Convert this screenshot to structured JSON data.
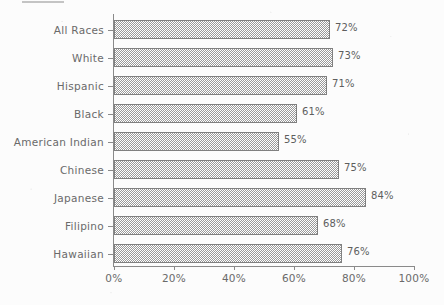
{
  "chart_data": {
    "type": "bar",
    "orientation": "horizontal",
    "title": "",
    "xlabel": "",
    "ylabel": "",
    "categories": [
      "All Races",
      "White",
      "Hispanic",
      "Black",
      "American Indian",
      "Chinese",
      "Japanese",
      "Filipino",
      "Hawaiian"
    ],
    "values": [
      72,
      73,
      71,
      61,
      55,
      75,
      84,
      68,
      76
    ],
    "value_labels": [
      "72%",
      "73%",
      "71%",
      "61%",
      "55%",
      "75%",
      "84%",
      "68%",
      "76%"
    ],
    "xlim": [
      0,
      100
    ],
    "xticks": [
      0,
      20,
      40,
      60,
      80,
      100
    ],
    "xtick_labels": [
      "0%",
      "20%",
      "40%",
      "60%",
      "80%",
      "100%"
    ],
    "grid": false,
    "legend": null,
    "bar_fill": "checkerboard-hatch",
    "bar_edge_color": "#808080",
    "text_color": "#6a6a6a",
    "background_color": "#fcfcfc"
  }
}
